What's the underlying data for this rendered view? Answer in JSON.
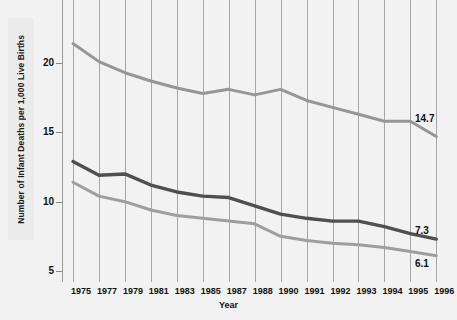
{
  "chart_data": {
    "type": "line",
    "title": "",
    "xlabel": "Year",
    "ylabel": "Number of Infant Deaths per 1,000 Live Births",
    "categories": [
      "1975",
      "1977",
      "1979",
      "1981",
      "1983",
      "1985",
      "1987",
      "1988",
      "1990",
      "1991",
      "1992",
      "1993",
      "1994",
      "1995",
      "1996"
    ],
    "xtick_labels": [
      "1975",
      "1977",
      "1979",
      "1981",
      "1983",
      "1985",
      "1987",
      "1988",
      "1990",
      "1991",
      "1992",
      "1993",
      "1994",
      "1995",
      "1996"
    ],
    "ytick_labels": [
      "5",
      "10",
      "15",
      "20"
    ],
    "ytick_values": [
      5,
      10,
      15,
      20
    ],
    "ylim": [
      4.2,
      23.0
    ],
    "grid": "vertical",
    "legend": "none",
    "series": [
      {
        "name": "upper",
        "color": "#969696",
        "end_label": "14.7",
        "values": [
          21.4,
          20.1,
          19.3,
          18.7,
          18.2,
          17.8,
          18.1,
          17.7,
          18.1,
          17.3,
          16.8,
          16.3,
          15.8,
          15.8,
          14.7
        ]
      },
      {
        "name": "middle",
        "color": "#4f4f4f",
        "end_label": "7.3",
        "values": [
          12.9,
          11.9,
          12.0,
          11.2,
          10.7,
          10.4,
          10.3,
          9.7,
          9.1,
          8.8,
          8.6,
          8.6,
          8.2,
          7.7,
          7.3
        ]
      },
      {
        "name": "lower",
        "color": "#9e9e9e",
        "end_label": "6.1",
        "values": [
          11.4,
          10.4,
          10.0,
          9.4,
          9.0,
          8.8,
          8.6,
          8.4,
          7.5,
          7.2,
          7.0,
          6.9,
          6.7,
          6.4,
          6.1
        ]
      }
    ],
    "end_labels": [
      "14.7",
      "7.3",
      "6.1"
    ],
    "colors": {
      "background": "#f2f2f2",
      "gridline": "#a6a6a6",
      "axis": "#9b9b9b",
      "text": "#111111",
      "upper_line": "#969696",
      "middle_line": "#4f4f4f",
      "lower_line": "#9e9e9e"
    }
  }
}
